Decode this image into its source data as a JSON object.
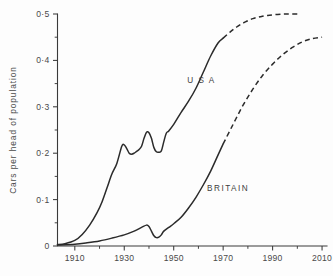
{
  "chart_data": {
    "type": "line",
    "title": "",
    "xlabel": "",
    "ylabel": "Cars per head of population",
    "xlim": [
      1903,
      2012
    ],
    "ylim": [
      0,
      0.5
    ],
    "grid": false,
    "legend_position": "inline-annotation",
    "x_ticks_major": [
      1910,
      1930,
      1950,
      1970,
      1990,
      2010
    ],
    "x_ticks_major_labels": [
      "1910",
      "1930",
      "1950",
      "1970",
      "1990",
      "2010"
    ],
    "x_ticks_minor": [
      1920,
      1940,
      1960,
      1980,
      2000
    ],
    "y_ticks_major": [
      0,
      0.1,
      0.2,
      0.3,
      0.4,
      0.5
    ],
    "y_ticks_major_labels": [
      "0",
      "0·1",
      "0·2",
      "0·3",
      "0·4",
      "0·5"
    ],
    "y_ticks_minor": [
      0.05,
      0.15,
      0.25,
      0.35,
      0.45
    ],
    "series": [
      {
        "name": "USA",
        "label": "U S A",
        "style_solid": "solid-historical",
        "style_projection": "dashed-projection",
        "projection_start_year": 1970,
        "x": [
          1903,
          1906,
          1910,
          1913,
          1916,
          1919,
          1921,
          1923,
          1925,
          1927,
          1929,
          1930,
          1931,
          1932,
          1933,
          1934,
          1935,
          1936,
          1937,
          1938,
          1939,
          1940,
          1941,
          1942,
          1943,
          1944,
          1945,
          1946,
          1947,
          1948,
          1950,
          1953,
          1956,
          1959,
          1962,
          1965,
          1968,
          1970
        ],
        "y": [
          0.003,
          0.005,
          0.012,
          0.025,
          0.045,
          0.072,
          0.095,
          0.125,
          0.155,
          0.178,
          0.215,
          0.218,
          0.21,
          0.2,
          0.198,
          0.2,
          0.204,
          0.208,
          0.215,
          0.232,
          0.245,
          0.244,
          0.232,
          0.212,
          0.203,
          0.202,
          0.205,
          0.225,
          0.243,
          0.248,
          0.262,
          0.288,
          0.312,
          0.34,
          0.375,
          0.41,
          0.438,
          0.448
        ],
        "x_projection": [
          1970,
          1973,
          1976,
          1979,
          1982,
          1985,
          1988,
          1992,
          1996,
          2000
        ],
        "y_projection": [
          0.448,
          0.462,
          0.474,
          0.483,
          0.49,
          0.494,
          0.497,
          0.499,
          0.5,
          0.5
        ]
      },
      {
        "name": "BRITAIN",
        "label": "BRITAIN",
        "style_solid": "solid-historical",
        "style_projection": "dashed-projection",
        "projection_start_year": 1970,
        "x": [
          1903,
          1910,
          1915,
          1920,
          1925,
          1930,
          1934,
          1937,
          1939,
          1940,
          1941,
          1942,
          1943,
          1944,
          1945,
          1946,
          1948,
          1950,
          1953,
          1956,
          1959,
          1962,
          1965,
          1968,
          1970
        ],
        "y": [
          0.002,
          0.004,
          0.007,
          0.011,
          0.017,
          0.024,
          0.032,
          0.04,
          0.045,
          0.042,
          0.032,
          0.022,
          0.018,
          0.019,
          0.024,
          0.032,
          0.04,
          0.048,
          0.062,
          0.082,
          0.105,
          0.132,
          0.162,
          0.197,
          0.22
        ],
        "x_projection": [
          1970,
          1974,
          1978,
          1982,
          1986,
          1990,
          1994,
          1998,
          2002,
          2006,
          2010
        ],
        "y_projection": [
          0.22,
          0.262,
          0.303,
          0.338,
          0.368,
          0.392,
          0.412,
          0.428,
          0.44,
          0.447,
          0.45
        ]
      }
    ]
  },
  "colors": {
    "background": "#fdfdfd",
    "line": "#2b2b2b",
    "axis": "#3a3a3a",
    "text": "#4a4a4a"
  }
}
